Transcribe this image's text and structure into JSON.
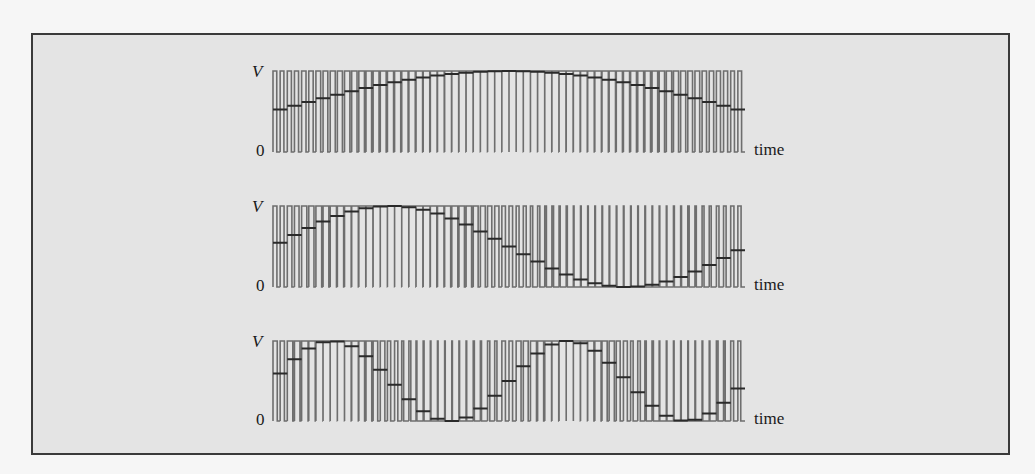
{
  "figure": {
    "frame_color": "#3a3a3a",
    "background": "#e4e4e4",
    "pulse_color": "#6e6e6e",
    "step_color": "#2a2a2a"
  },
  "panels": [
    {
      "y_label": "V",
      "zero_label": "0",
      "x_label": "time",
      "sine_cycles": 0.5,
      "phase": 0,
      "pulses": 66,
      "pulses_per_step": 2,
      "top": 71,
      "bottom": 152
    },
    {
      "y_label": "V",
      "zero_label": "0",
      "x_label": "time",
      "sine_cycles": 1,
      "phase": 0,
      "pulses": 66,
      "pulses_per_step": 2,
      "top": 206,
      "bottom": 287
    },
    {
      "y_label": "V",
      "zero_label": "0",
      "x_label": "time",
      "sine_cycles": 2,
      "phase": 0,
      "pulses": 66,
      "pulses_per_step": 2,
      "top": 341,
      "bottom": 421
    }
  ],
  "chart_data": {
    "type": "line",
    "xlabel": "time",
    "ylabel": "V",
    "ylim": [
      0,
      1
    ],
    "series": [
      {
        "name": "panel 1 (half cycle)",
        "description": "V = 0.5 + 0.5·sin(πt), 0.5 → 1 → 0.5"
      },
      {
        "name": "panel 2 (one cycle)",
        "description": "V = 0.5 + 0.5·sin(2πt), 0.5 → 1 → 0 → 0.5"
      },
      {
        "name": "panel 3 (two cycles)",
        "description": "V = 0.5 + 0.5·sin(4πt)"
      }
    ],
    "grid": false,
    "legend": "none"
  }
}
